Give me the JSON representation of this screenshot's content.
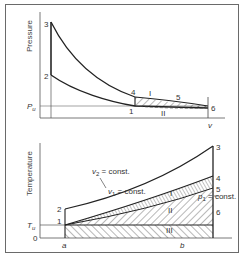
{
  "upper_panel": {
    "y_axis_label": "Pressure",
    "x_axis_label": "v",
    "reference_label_main": "P",
    "reference_label_sub": "u",
    "points": {
      "p1": "1",
      "p2": "2",
      "p3": "3",
      "p4": "4",
      "p5": "5",
      "p6": "6"
    },
    "regions": {
      "r1": "I",
      "r2": "II"
    }
  },
  "lower_panel": {
    "y_axis_label": "Temperature",
    "origin_label": "0",
    "reference_label_main": "T",
    "reference_label_sub": "u",
    "x_marks": {
      "a": "a",
      "b": "b"
    },
    "points": {
      "p1": "1",
      "p2": "2",
      "p3": "3",
      "p4": "4",
      "p5": "5",
      "p6": "6"
    },
    "regions": {
      "r1": "I",
      "r2": "II",
      "r3": "III"
    },
    "curves": {
      "v2": {
        "sym": "v",
        "sub": "2",
        "rest": " = const."
      },
      "v1": {
        "sym": "v",
        "sub": "1",
        "rest": " = const."
      },
      "p1": {
        "sym": "p",
        "sub": "1",
        "rest": " = const."
      }
    }
  },
  "colors": {
    "line": "#222222",
    "thin": "#555555",
    "frame": "#6a6a6a",
    "text": "#333333"
  }
}
